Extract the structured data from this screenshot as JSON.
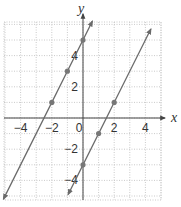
{
  "chart_data": {
    "type": "line",
    "title": "",
    "xlabel": "x",
    "ylabel": "y",
    "xlim": [
      -5,
      5
    ],
    "ylim": [
      -5.2,
      6.2
    ],
    "grid": true,
    "grid_style": "dotted",
    "x_ticks": [
      -4,
      -2,
      0,
      2,
      4
    ],
    "x_tick_labels": [
      "−4",
      "−2",
      "0",
      "2",
      "4"
    ],
    "y_ticks": [
      -4,
      -2,
      2,
      4
    ],
    "y_tick_labels": [
      "−4",
      "−2",
      "2",
      "4"
    ],
    "series": [
      {
        "name": "y = 2x + 5",
        "slope": 2,
        "intercept": 5,
        "x_range": [
          -5.1,
          0.6
        ],
        "points": [
          [
            -2,
            1
          ],
          [
            -1,
            3
          ],
          [
            0,
            5
          ]
        ]
      },
      {
        "name": "y = 2x − 3",
        "slope": 2,
        "intercept": -3,
        "x_range": [
          -0.95,
          4.35
        ],
        "points": [
          [
            0,
            -3
          ],
          [
            1,
            -1
          ],
          [
            2,
            1
          ]
        ]
      }
    ],
    "colors": {
      "line": "#6a6a6a",
      "point": "#777777",
      "grid": "#bdbdbd",
      "axis": "#444444"
    }
  }
}
